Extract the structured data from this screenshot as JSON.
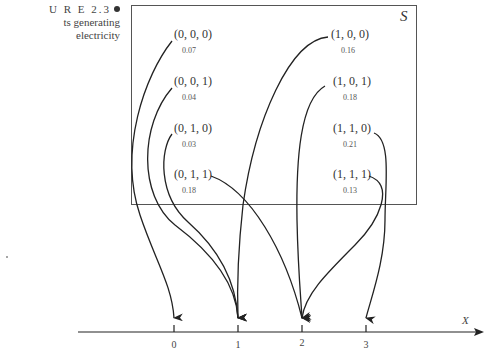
{
  "caption": {
    "line1": "U R E 2.3",
    "line2": "ts generating",
    "line3": "electricity"
  },
  "sample_space_label": "S",
  "outcomes": [
    {
      "label": "(0, 0, 0)",
      "prob": "0.07",
      "maps_to": "0"
    },
    {
      "label": "(0, 0, 1)",
      "prob": "0.04",
      "maps_to": "1"
    },
    {
      "label": "(0, 1, 0)",
      "prob": "0.03",
      "maps_to": "1"
    },
    {
      "label": "(0, 1, 1)",
      "prob": "0.18",
      "maps_to": "2"
    },
    {
      "label": "(1, 0, 0)",
      "prob": "0.16",
      "maps_to": "1"
    },
    {
      "label": "(1, 0, 1)",
      "prob": "0.18",
      "maps_to": "2"
    },
    {
      "label": "(1, 1, 0)",
      "prob": "0.21",
      "maps_to": "3"
    },
    {
      "label": "(1, 1, 1)",
      "prob": "0.13",
      "maps_to": "2"
    }
  ],
  "axis": {
    "label": "X",
    "ticks": [
      "0",
      "1",
      "2",
      "3"
    ]
  }
}
